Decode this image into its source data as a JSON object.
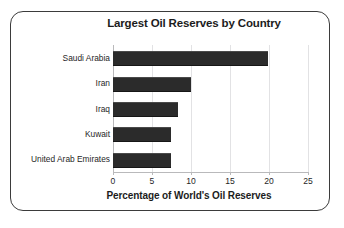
{
  "chart_data": {
    "type": "bar",
    "orientation": "horizontal",
    "title": "Largest Oil Reserves by Country",
    "xlabel": "Percentage of World's Oil Reserves",
    "ylabel": "",
    "categories": [
      "Saudi Arabia",
      "Iran",
      "Iraq",
      "Kuwait",
      "United Arab Emirates"
    ],
    "values": [
      19.9,
      10.0,
      8.3,
      7.4,
      7.4
    ],
    "series": [
      {
        "name": "Percentage of World's Oil Reserves",
        "values": [
          19.9,
          10.0,
          8.3,
          7.4,
          7.4
        ]
      }
    ],
    "xlim": [
      0,
      25
    ],
    "xticks": [
      0,
      5,
      10,
      15,
      20,
      25
    ],
    "xtick_labels": [
      "0",
      "5",
      "10",
      "15",
      "20",
      "25"
    ],
    "grid": "vertical",
    "legend": "none",
    "bar_color": "#2b2b2b",
    "gridline_color": "#e2e2e4",
    "axis_color": "#b9b9bb",
    "frame_color": "#3b3b3b",
    "background_color": "#ffffff"
  }
}
